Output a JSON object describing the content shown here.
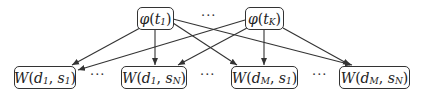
{
  "diagram": {
    "top_nodes": [
      {
        "id": "phi_t1",
        "func": "φ",
        "arg": "t",
        "sub": "1"
      },
      {
        "id": "phi_tK",
        "func": "φ",
        "arg": "t",
        "sub": "K"
      }
    ],
    "top_ellipsis": "···",
    "bottom_nodes": [
      {
        "id": "W_d1_s1",
        "func": "W",
        "a": "d",
        "a_sub": "1",
        "b": "s",
        "b_sub": "1"
      },
      {
        "id": "W_d1_sN",
        "func": "W",
        "a": "d",
        "a_sub": "1",
        "b": "s",
        "b_sub": "N"
      },
      {
        "id": "W_dM_s1",
        "func": "W",
        "a": "d",
        "a_sub": "M",
        "b": "s",
        "b_sub": "1"
      },
      {
        "id": "W_dM_sN",
        "func": "W",
        "a": "d",
        "a_sub": "M",
        "b": "s",
        "b_sub": "N"
      }
    ],
    "bottom_ellipses": [
      "···",
      "···",
      "···"
    ],
    "edges": [
      [
        "phi_t1",
        "W_d1_s1"
      ],
      [
        "phi_t1",
        "W_d1_sN"
      ],
      [
        "phi_t1",
        "W_dM_s1"
      ],
      [
        "phi_t1",
        "W_dM_sN"
      ],
      [
        "phi_tK",
        "W_d1_s1"
      ],
      [
        "phi_tK",
        "W_d1_sN"
      ],
      [
        "phi_tK",
        "W_dM_s1"
      ],
      [
        "phi_tK",
        "W_dM_sN"
      ]
    ],
    "stroke_color": "#333333"
  }
}
